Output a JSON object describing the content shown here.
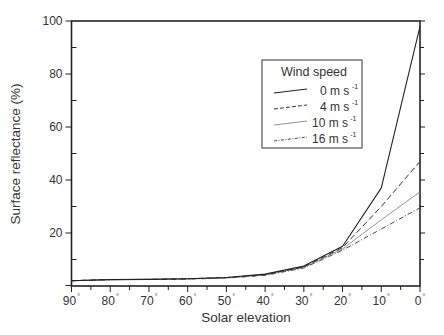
{
  "chart_data": {
    "type": "line",
    "title": "",
    "xlabel": "Solar elevation",
    "ylabel": "Surface reflectance (%)",
    "x": [
      90,
      80,
      70,
      60,
      50,
      40,
      30,
      20,
      10,
      0
    ],
    "x_tick_labels": [
      "90°",
      "80°",
      "70°",
      "60°",
      "50°",
      "40°",
      "30°",
      "20°",
      "10°",
      "0°"
    ],
    "xlim": [
      90,
      0
    ],
    "ylim": [
      0,
      100
    ],
    "y_ticks": [
      20,
      40,
      60,
      80,
      100
    ],
    "y_tick_labels": [
      "20",
      "40",
      "60",
      "80",
      "100"
    ],
    "grid": false,
    "legend": {
      "title": "Wind speed",
      "position": "upper right (inside)"
    },
    "series": [
      {
        "name": "0 m s-1",
        "label_main": "0 m s",
        "label_sup": "-1",
        "style": "solid",
        "color": "#222222",
        "width": 1.1,
        "values": [
          2.0,
          2.4,
          2.5,
          2.7,
          3.2,
          4.5,
          7.5,
          15.0,
          37.0,
          98.0
        ]
      },
      {
        "name": "4 m s-1",
        "label_main": "4 m s",
        "label_sup": "-1",
        "style": "dashed",
        "color": "#333333",
        "width": 1.0,
        "values": [
          2.0,
          2.4,
          2.5,
          2.7,
          3.2,
          4.3,
          7.2,
          14.5,
          30.0,
          47.0
        ]
      },
      {
        "name": "10 m s-1",
        "label_main": "10 m s",
        "label_sup": "-1",
        "style": "thin-solid",
        "color": "#777777",
        "width": 0.8,
        "values": [
          2.0,
          2.4,
          2.5,
          2.7,
          3.1,
          4.2,
          7.0,
          14.0,
          25.0,
          35.5
        ]
      },
      {
        "name": "16 m s-1",
        "label_main": "16 m s",
        "label_sup": "-1",
        "style": "dash-dot",
        "color": "#333333",
        "width": 0.9,
        "values": [
          2.0,
          2.4,
          2.5,
          2.6,
          3.0,
          4.0,
          6.8,
          13.5,
          21.5,
          29.5
        ]
      }
    ]
  }
}
